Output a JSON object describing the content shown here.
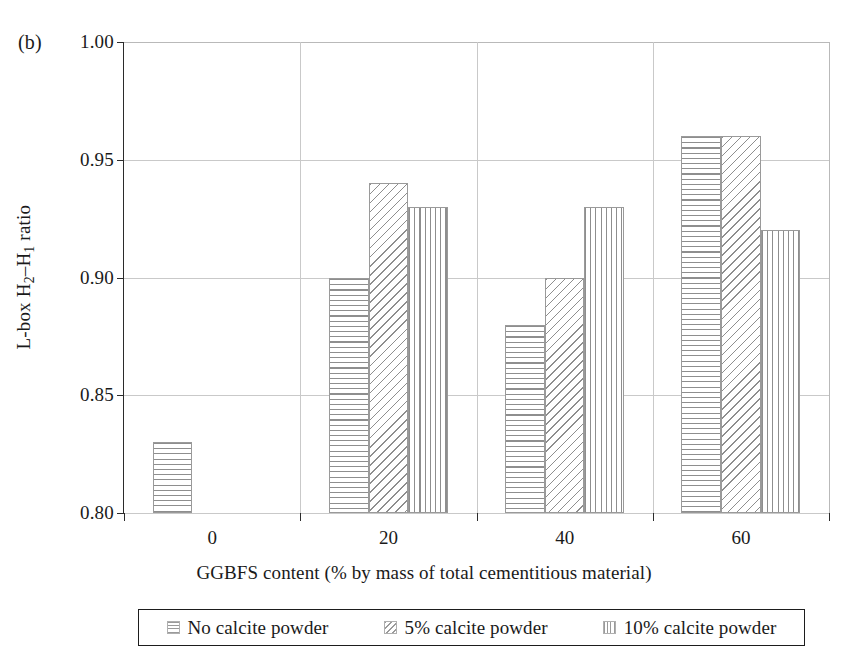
{
  "panel_label": "(b)",
  "chart_data": {
    "type": "bar",
    "title": "",
    "panel": "(b)",
    "categories": [
      "0",
      "20",
      "40",
      "60"
    ],
    "series": [
      {
        "name": "No calcite powder",
        "pattern": "horizontal-hatch",
        "values": [
          0.83,
          0.9,
          0.88,
          0.96
        ]
      },
      {
        "name": "5% calcite powder",
        "pattern": "diagonal-hatch",
        "values": [
          null,
          0.94,
          0.9,
          0.96
        ]
      },
      {
        "name": "10% calcite powder",
        "pattern": "vertical-hatch",
        "values": [
          null,
          0.93,
          0.93,
          0.92
        ]
      }
    ],
    "xlabel": "GGBFS content (% by mass of total cementitious material)",
    "ylabel": "L-box H2-H1 ratio",
    "ylim": [
      0.8,
      1.0
    ],
    "yticks": [
      "0.80",
      "0.85",
      "0.90",
      "0.95",
      "1.00"
    ],
    "ytick_values": [
      0.8,
      0.85,
      0.9,
      0.95,
      1.0
    ],
    "grid": "horizontal-and-vertical",
    "legend_position": "below-axes",
    "colors": {
      "hatch": "#8e8e8e",
      "bar_border": "#9a9a9a",
      "axis": "#2b2b2b",
      "gridline": "#c9c9c9",
      "legend_border": "#1d1d1d",
      "background": "#ffffff"
    }
  },
  "yaxis": {
    "title_prefix": "L-box H",
    "title_sub1": "2",
    "title_mid": "–H",
    "title_sub2": "1",
    "title_suffix": " ratio",
    "ticks": [
      {
        "label": "1.00",
        "value": 1.0
      },
      {
        "label": "0.95",
        "value": 0.95
      },
      {
        "label": "0.90",
        "value": 0.9
      },
      {
        "label": "0.85",
        "value": 0.85
      },
      {
        "label": "0.80",
        "value": 0.8
      }
    ]
  },
  "xaxis": {
    "title": "GGBFS content (% by mass of total cementitious material)",
    "ticks": [
      {
        "label": "0",
        "value": 0
      },
      {
        "label": "20",
        "value": 20
      },
      {
        "label": "40",
        "value": 40
      },
      {
        "label": "60",
        "value": 60
      }
    ]
  },
  "legend": {
    "items": [
      {
        "label": "No calcite powder",
        "pattern": "horizontal-hatch"
      },
      {
        "label": "5% calcite powder",
        "pattern": "diagonal-hatch"
      },
      {
        "label": "10% calcite powder",
        "pattern": "vertical-hatch"
      }
    ]
  }
}
